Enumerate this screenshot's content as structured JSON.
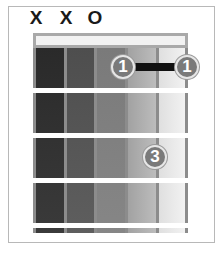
{
  "diagram": {
    "type": "guitar-chord-chart",
    "string_markers": [
      {
        "label": "X",
        "meaning": "muted",
        "string": 6
      },
      {
        "label": "X",
        "meaning": "muted",
        "string": 5
      },
      {
        "label": "O",
        "meaning": "open",
        "string": 4
      }
    ],
    "fingerings": [
      {
        "finger": "1",
        "string": 2,
        "fret": 1
      },
      {
        "finger": "1",
        "string": 1,
        "fret": 1
      },
      {
        "finger": "3",
        "string": 2,
        "fret": 3
      }
    ],
    "barre": {
      "finger": "1",
      "from_string": 2,
      "to_string": 1,
      "fret": 1
    },
    "frets_shown": 4,
    "strings": 6,
    "colors": {
      "frame_border": "#b8b8b8",
      "nut_border": "#a9a9a9",
      "string": "#8c8c8c",
      "dot": "#7a7a7a",
      "barre": "#111111",
      "column_shades": [
        "#2e2e2e",
        "#555555",
        "#808080",
        "#aaaaaa",
        "#e9e9e9"
      ]
    }
  }
}
